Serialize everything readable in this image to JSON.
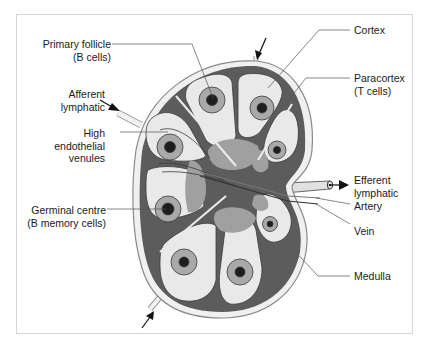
{
  "colors": {
    "dark_tissue": "#5a5a5a",
    "cortex_light": "#e8e8e8",
    "capsule": "#f2f2f2",
    "paracortex": "#9c9c9c",
    "follicle_ring": "#a9a9a9",
    "follicle_center": "#222222",
    "leader_line": "#555555",
    "frame_border": "#d6d6d6"
  },
  "labels": {
    "primary_follicle": {
      "line1": "Primary follicle",
      "line2": "(B cells)"
    },
    "afferent_lymphatic": {
      "line1": "Afferent",
      "line2": "lymphatic"
    },
    "high_endothelial_venules": {
      "line1": "High",
      "line2": "endothelial",
      "line3": "venules"
    },
    "germinal_centre": {
      "line1": "Germinal centre",
      "line2": "(B memory cells)"
    },
    "cortex": {
      "line1": "Cortex"
    },
    "paracortex": {
      "line1": "Paracortex",
      "line2": "(T cells)"
    },
    "efferent_lymphatic": {
      "line1": "Efferent",
      "line2": "lymphatic"
    },
    "artery": {
      "line1": "Artery"
    },
    "vein": {
      "line1": "Vein"
    },
    "medulla": {
      "line1": "Medulla"
    }
  }
}
